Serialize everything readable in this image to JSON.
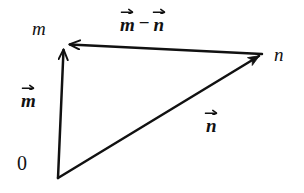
{
  "figure": {
    "background_color": "#ffffff",
    "stroke_color": "#111111"
  },
  "labels": {
    "point_m": "m",
    "point_n": "n",
    "origin": "0",
    "vector_m": "m",
    "vector_n": "n",
    "difference_left": "m",
    "difference_op": "−",
    "difference_right": "n"
  },
  "diagram_data": {
    "type": "diagram",
    "description": "Vector triangle showing the subtraction of two vectors drawn from a common origin.",
    "points": [
      {
        "name": "0",
        "label": "0",
        "x": 58,
        "y": 178
      },
      {
        "name": "m",
        "label": "m",
        "x": 63,
        "y": 47
      },
      {
        "name": "n",
        "label": "n",
        "x": 262,
        "y": 53
      }
    ],
    "vectors": [
      {
        "name": "m-vector",
        "label": "m",
        "accent": "arrow",
        "from": "0",
        "to": "m",
        "from_xy": [
          58,
          178
        ],
        "to_xy": [
          63,
          47
        ],
        "arrowhead_at": "to",
        "label_xy": [
          31,
          96
        ]
      },
      {
        "name": "n-vector",
        "label": "n",
        "accent": "arrow",
        "from": "0",
        "to": "n",
        "from_xy": [
          58,
          178
        ],
        "to_xy": [
          262,
          53
        ],
        "arrowhead_at": "to",
        "label_xy": [
          215,
          121
        ]
      },
      {
        "name": "m-minus-n-vector",
        "label": "m − n",
        "accent": "arrow",
        "from": "n",
        "to": "m",
        "from_xy": [
          262,
          53
        ],
        "to_xy": [
          63,
          44
        ],
        "arrowhead_at": "to",
        "label_xy": [
          155,
          22
        ]
      }
    ]
  }
}
